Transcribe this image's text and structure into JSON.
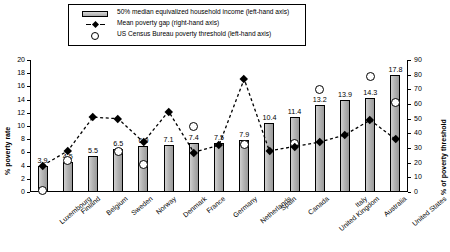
{
  "legend": {
    "items": [
      {
        "key": "bar-swatch",
        "label": "50% median equivalized household income (left-hand axis)"
      },
      {
        "key": "line-swatch",
        "label": "Mean poverty gap (right-hand axis)"
      },
      {
        "key": "circle-swatch",
        "label": "US Census Bureau poverty threshold (left-hand axis)"
      }
    ]
  },
  "axes": {
    "left_title": "% poverty rate",
    "right_title": "% of poverty threshold",
    "left_ticks": [
      "0",
      "2",
      "4",
      "6",
      "8",
      "10",
      "12",
      "14",
      "16",
      "18",
      "20"
    ],
    "right_ticks": [
      "0",
      "10",
      "20",
      "30",
      "40",
      "50",
      "60",
      "70",
      "80",
      "90"
    ]
  },
  "chart_data": {
    "type": "bar",
    "title": "",
    "xlabel": "",
    "ylabel": "% poverty rate",
    "y2label": "% of poverty threshold",
    "ylim": [
      0,
      20
    ],
    "y2lim": [
      0,
      90
    ],
    "grid": false,
    "legend_position": "top",
    "categories": [
      "Luxembourg",
      "Finland",
      "Belgium",
      "Sweden",
      "Norway",
      "Denmark",
      "France",
      "Germany",
      "Netherlands",
      "Spain",
      "Canada",
      "United Kingdom",
      "Italy",
      "Australia",
      "United States"
    ],
    "series": [
      {
        "name": "50% median equivalized household income (left-hand axis)",
        "axis": "left",
        "type": "bar",
        "values": [
          3.9,
          4.5,
          5.5,
          6.5,
          6.9,
          7.1,
          7.4,
          7.5,
          7.9,
          10.4,
          11.4,
          13.2,
          13.9,
          14.3,
          17.8
        ],
        "labels": [
          "3.9",
          "4.5",
          "5.5",
          "6.5",
          "6.9",
          "7.1",
          "7.4",
          "7.5",
          "7.9",
          "10.4",
          "11.4",
          "13.2",
          "13.9",
          "14.3",
          "17.8"
        ]
      },
      {
        "name": "Mean poverty gap (right-hand axis)",
        "axis": "right",
        "type": "line",
        "values": [
          18,
          28,
          51,
          50,
          34,
          55,
          27,
          32,
          77,
          28,
          31,
          34,
          39,
          49,
          36
        ]
      },
      {
        "name": "US Census Bureau poverty threshold (left-hand axis)",
        "axis": "left",
        "type": "scatter",
        "values": [
          0.3,
          4.8,
          null,
          6.2,
          4.2,
          null,
          9.9,
          null,
          7.2,
          null,
          7.3,
          15.6,
          null,
          17.5,
          13.6
        ]
      }
    ]
  }
}
